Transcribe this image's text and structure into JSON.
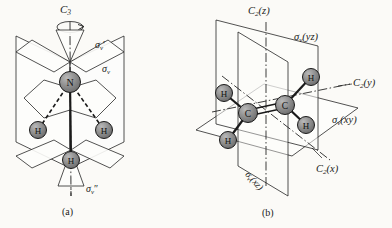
{
  "figure": {
    "background_color": "#fbfaf7",
    "line_color": "#1a1a1a",
    "atom_fill": "#8c8c8c",
    "atom_stroke": "#1a1a1a",
    "plane_fill": "#fdfdfb"
  },
  "panel_a": {
    "caption": "(a)",
    "molecule": "NH3",
    "atoms": [
      {
        "element": "N",
        "label": "N",
        "x": 70,
        "y": 82,
        "r": 10.5
      },
      {
        "element": "H",
        "label": "H",
        "x": 38,
        "y": 130,
        "r": 8.5
      },
      {
        "element": "H",
        "label": "H",
        "x": 104,
        "y": 130,
        "r": 8.5
      },
      {
        "element": "H",
        "label": "H",
        "x": 71,
        "y": 160,
        "r": 8.5
      }
    ],
    "bonds": [
      {
        "from": "N",
        "to": "H-left",
        "style": "dashed"
      },
      {
        "from": "N",
        "to": "H-right",
        "style": "dashed"
      },
      {
        "from": "N",
        "to": "H-front",
        "style": "solid"
      }
    ],
    "labels": {
      "axis": {
        "symbol": "C",
        "sub": "3",
        "text": "C3",
        "x": 62,
        "y": 6
      },
      "mirror_1": {
        "symbol": "σ",
        "sub": "v",
        "prime": "′",
        "text": "σv′",
        "x": 96,
        "y": 42
      },
      "mirror_2": {
        "symbol": "σ",
        "sub": "v",
        "prime": "",
        "text": "σv",
        "x": 103,
        "y": 67
      },
      "mirror_3": {
        "symbol": "σ",
        "sub": "v",
        "prime": "″",
        "text": "σv″",
        "x": 88,
        "y": 186
      }
    }
  },
  "panel_b": {
    "caption": "(b)",
    "molecule": "C2H4",
    "atoms": [
      {
        "element": "C",
        "label": "C",
        "x": 248,
        "y": 113,
        "r": 9.5
      },
      {
        "element": "C",
        "label": "C",
        "x": 285,
        "y": 105,
        "r": 9.5
      },
      {
        "element": "H",
        "label": "H",
        "x": 224,
        "y": 93,
        "r": 8.5
      },
      {
        "element": "H",
        "label": "H",
        "x": 228,
        "y": 140,
        "r": 8.5
      },
      {
        "element": "H",
        "label": "H",
        "x": 311,
        "y": 77,
        "r": 8.5
      },
      {
        "element": "H",
        "label": "H",
        "x": 306,
        "y": 125,
        "r": 8.5
      }
    ],
    "bonds": [
      {
        "from": "C1",
        "to": "C2",
        "style": "double"
      },
      {
        "from": "C1",
        "to": "H-upper-left",
        "style": "solid"
      },
      {
        "from": "C1",
        "to": "H-lower-left",
        "style": "solid"
      },
      {
        "from": "C2",
        "to": "H-upper-right",
        "style": "solid"
      },
      {
        "from": "C2",
        "to": "H-lower-right",
        "style": "solid"
      }
    ],
    "labels": {
      "axis_z": {
        "symbol": "C",
        "sub": "2",
        "arg": "(z)",
        "text": "C2(z)",
        "x": 249,
        "y": 10
      },
      "axis_y": {
        "symbol": "C",
        "sub": "2",
        "arg": "(y)",
        "text": "C2(y)",
        "x": 352,
        "y": 81
      },
      "axis_x": {
        "symbol": "C",
        "sub": "2",
        "arg": "(x)",
        "text": "C2(x)",
        "x": 314,
        "y": 167
      },
      "mirror_yz": {
        "symbol": "σ",
        "sub": "v",
        "arg": "(yz)",
        "text": "σv(yz)",
        "x": 296,
        "y": 36
      },
      "mirror_xy": {
        "symbol": "σ",
        "sub": "v",
        "arg": "(xy)",
        "text": "σv(xy)",
        "x": 333,
        "y": 118
      },
      "mirror_xz": {
        "symbol": "σ",
        "sub": "v",
        "arg": "(xz)",
        "text": "σv(xz)",
        "x": 254,
        "y": 172
      }
    }
  }
}
